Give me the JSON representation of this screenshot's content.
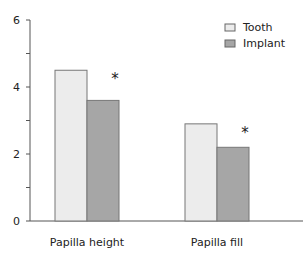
{
  "chart_data": {
    "type": "bar",
    "title": "",
    "xlabel": "",
    "ylabel": "",
    "ylim": [
      0,
      6
    ],
    "yticks": [
      0,
      2,
      4,
      6
    ],
    "categories": [
      "Papilla height",
      "Papilla fill"
    ],
    "series": [
      {
        "name": "Tooth",
        "values": [
          4.5,
          2.9
        ],
        "color": "#ececec"
      },
      {
        "name": "Implant",
        "values": [
          3.6,
          2.2
        ],
        "color": "#a6a6a6"
      }
    ],
    "annotations": [
      "*",
      "*"
    ],
    "legend_position": "top-right",
    "grid": false
  }
}
